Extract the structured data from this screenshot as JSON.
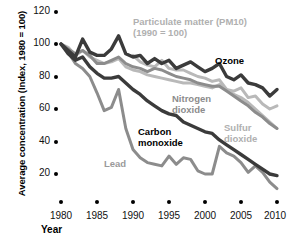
{
  "chart_data": {
    "type": "line",
    "title": "",
    "xlabel": "Year",
    "ylabel": "Average concentration (Index, 1980 = 100)",
    "xlim": [
      1980,
      2010
    ],
    "ylim": [
      0,
      120
    ],
    "grid": false,
    "legend": "inline-annotations",
    "xticks": [
      "1980",
      "1985",
      "1990",
      "1995",
      "2000",
      "2005",
      "2010"
    ],
    "yticks": [
      "20",
      "40",
      "60",
      "80",
      "100",
      "120"
    ],
    "x": [
      1980,
      1981,
      1982,
      1983,
      1984,
      1985,
      1986,
      1987,
      1988,
      1989,
      1990,
      1991,
      1992,
      1993,
      1994,
      1995,
      1996,
      1997,
      1998,
      1999,
      2000,
      2001,
      2002,
      2003,
      2004,
      2005,
      2006,
      2007,
      2008,
      2009,
      2010
    ],
    "series": [
      {
        "name": "Ozone",
        "color": "#3b3b3b",
        "label_text": "Ozone",
        "values": [
          100,
          96,
          92,
          103,
          95,
          93,
          93,
          97,
          105,
          94,
          92,
          93,
          88,
          91,
          88,
          90,
          85,
          87,
          89,
          86,
          83,
          85,
          88,
          80,
          78,
          81,
          76,
          75,
          73,
          68,
          72
        ]
      },
      {
        "name": "Particulate matter (PM10)",
        "color": "#b9b9b9",
        "label_text": "Particulate matter (PM10)\n(1990 = 100)",
        "note": "indexed 1990 = 100",
        "values": [
          null,
          null,
          null,
          null,
          null,
          null,
          null,
          null,
          null,
          null,
          93,
          89,
          87,
          86,
          90,
          85,
          84,
          84,
          82,
          80,
          79,
          77,
          78,
          72,
          71,
          73,
          67,
          68,
          63,
          60,
          62
        ]
      },
      {
        "name": "Nitrogen dioxide",
        "color": "#8c8c8c",
        "label_text": "Nitrogen\ndioxide",
        "values": [
          100,
          97,
          94,
          96,
          93,
          88,
          88,
          90,
          92,
          88,
          86,
          85,
          83,
          85,
          84,
          82,
          80,
          79,
          78,
          76,
          75,
          74,
          74,
          71,
          68,
          65,
          62,
          58,
          55,
          51,
          48
        ]
      },
      {
        "name": "Sulfur dioxide",
        "color": "#b9b9b9",
        "label_text": "Sulfur\ndioxide",
        "values": [
          100,
          98,
          93,
          96,
          92,
          90,
          88,
          89,
          91,
          86,
          84,
          83,
          81,
          80,
          79,
          78,
          77,
          76,
          76,
          75,
          74,
          73,
          75,
          72,
          69,
          67,
          64,
          60,
          56,
          52,
          48
        ]
      },
      {
        "name": "Carbon monoxide",
        "color": "#3b3b3b",
        "label_text": "Carbon\nmonoxide",
        "values": [
          100,
          94,
          90,
          92,
          86,
          82,
          79,
          79,
          80,
          76,
          72,
          69,
          65,
          62,
          59,
          57,
          56,
          52,
          50,
          48,
          46,
          45,
          41,
          38,
          35,
          32,
          29,
          26,
          23,
          20,
          19
        ]
      },
      {
        "name": "Lead",
        "color": "#8c8c8c",
        "label_text": "Lead",
        "values": [
          100,
          95,
          88,
          85,
          80,
          70,
          59,
          61,
          72,
          48,
          35,
          30,
          27,
          26,
          25,
          31,
          26,
          30,
          29,
          22,
          20,
          20,
          37,
          33,
          31,
          27,
          21,
          25,
          21,
          15,
          11
        ]
      }
    ]
  },
  "axis": {
    "y_title": "Average concentration (Index, 1980 = 100)",
    "x_title": "Year"
  }
}
